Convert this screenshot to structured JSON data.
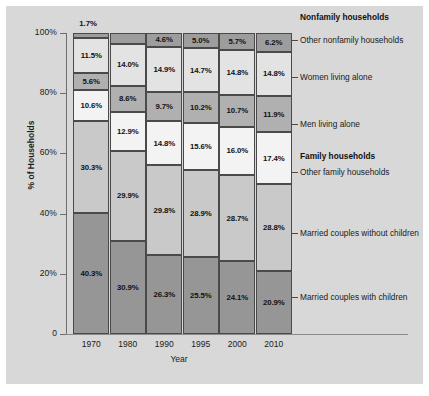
{
  "chart_data": {
    "type": "bar",
    "subtype": "stacked-bar-100-percent",
    "title": "",
    "xlabel": "Year",
    "ylabel": "% of Households",
    "categories": [
      "1970",
      "1980",
      "1990",
      "1995",
      "2000",
      "2010"
    ],
    "ylim": [
      0,
      100
    ],
    "ytick_labels": [
      "100%",
      "80%",
      "60%",
      "40%",
      "20%",
      "0"
    ],
    "ytick_values": [
      100,
      80,
      60,
      40,
      20,
      0
    ],
    "grid": false,
    "legend_position": "right",
    "legend_groups": [
      {
        "label": "Nonfamily households"
      },
      {
        "label": "Family households"
      }
    ],
    "series": [
      {
        "name": "Other nonfamily households",
        "group": "Nonfamily households",
        "color": "#9d9d9d",
        "values": [
          1.7,
          3.6,
          4.6,
          5.0,
          5.7,
          6.2
        ],
        "labels": [
          "1.7%",
          "3.6%",
          "4.6%",
          "5.0%",
          "5.7%",
          "6.2%"
        ]
      },
      {
        "name": "Women living alone",
        "group": "Nonfamily households",
        "color": "#e3e3e3",
        "values": [
          11.5,
          14.0,
          14.9,
          14.7,
          14.8,
          14.8
        ],
        "labels": [
          "11.5%",
          "14.0%",
          "14.9%",
          "14.7%",
          "14.8%",
          "14.8%"
        ]
      },
      {
        "name": "Men living alone",
        "group": "Nonfamily households",
        "color": "#b0b0b0",
        "values": [
          5.6,
          8.6,
          9.7,
          10.2,
          10.7,
          11.9
        ],
        "labels": [
          "5.6%",
          "8.6%",
          "9.7%",
          "10.2%",
          "10.7%",
          "11.9%"
        ]
      },
      {
        "name": "Other family households",
        "group": "Family households",
        "color": "#f3f3f3",
        "values": [
          10.6,
          12.9,
          14.8,
          15.6,
          16.0,
          17.4
        ],
        "labels": [
          "10.6%",
          "12.9%",
          "14.8%",
          "15.6%",
          "16.0%",
          "17.4%"
        ]
      },
      {
        "name": "Married couples without children",
        "group": "Family households",
        "color": "#c9c9c9",
        "values": [
          30.3,
          29.9,
          29.8,
          28.9,
          28.7,
          28.8
        ],
        "labels": [
          "30.3%",
          "29.9%",
          "29.8%",
          "28.9%",
          "28.7%",
          "28.8%"
        ]
      },
      {
        "name": "Married couples with children",
        "group": "Family households",
        "color": "#969696",
        "values": [
          40.3,
          30.9,
          26.3,
          25.5,
          24.1,
          20.9
        ],
        "labels": [
          "40.3%",
          "30.9%",
          "26.3%",
          "25.5%",
          "24.1%",
          "20.9%"
        ]
      }
    ],
    "annotations": [
      {
        "text": "1.7%",
        "note": "callout above 1970 bar for thin top segment"
      }
    ]
  },
  "axis": {
    "y_title": "% of Households",
    "x_title": "Year",
    "y_ticks": [
      "100%",
      "80%",
      "60%",
      "40%",
      "20%",
      "0"
    ],
    "x_ticks": [
      "1970",
      "1980",
      "1990",
      "1995",
      "2000",
      "2010"
    ]
  },
  "legend": {
    "nonfamily_header": "Nonfamily households",
    "family_header": "Family households",
    "other_nonfamily": "Other nonfamily households",
    "women_alone": "Women living alone",
    "men_alone": "Men living alone",
    "other_family": "Other family households",
    "married_without": "Married couples without children",
    "married_with": "Married couples with children"
  },
  "callout": {
    "top_1970": "1.7%"
  }
}
